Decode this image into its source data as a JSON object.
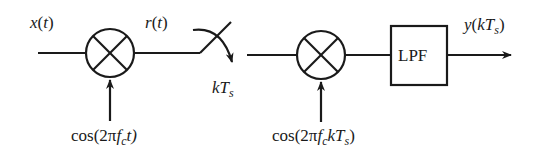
{
  "diagram": {
    "type": "block-diagram",
    "signals": {
      "input": {
        "name": "x",
        "arg": "t"
      },
      "mixed": {
        "name": "r",
        "arg": "t"
      },
      "sampling": {
        "text": "kT",
        "sub": "s"
      },
      "output": {
        "name": "y",
        "arg_pre": "kT",
        "arg_sub": "s"
      }
    },
    "blocks": [
      {
        "id": "mixer-1",
        "type": "multiplier",
        "oscillator": {
          "prefix": "cos(2π",
          "f": "f",
          "f_sub": "c",
          "suffix": "t)"
        }
      },
      {
        "id": "sampler",
        "type": "switch",
        "label": "kTs"
      },
      {
        "id": "mixer-2",
        "type": "multiplier",
        "oscillator": {
          "prefix": "cos(2π",
          "f": "f",
          "f_sub": "c",
          "mid": "kT",
          "mid_sub": "s",
          "suffix": ")"
        }
      },
      {
        "id": "lpf",
        "type": "filter",
        "label": "LPF"
      }
    ],
    "colors": {
      "stroke": "#1a1a1a",
      "background": "#ffffff"
    }
  }
}
